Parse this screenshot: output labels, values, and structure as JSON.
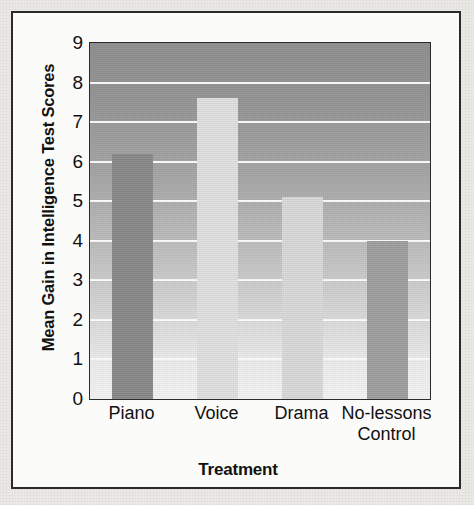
{
  "chart_data": {
    "type": "bar",
    "title": "",
    "subtitle": "",
    "xlabel": "Treatment",
    "ylabel": "Mean Gain in Intelligence Test Scores",
    "categories": [
      "Piano",
      "Voice",
      "Drama",
      "No-lessons Control"
    ],
    "category_lines": [
      [
        "Piano"
      ],
      [
        "Voice"
      ],
      [
        "Drama"
      ],
      [
        "No-lessons",
        "Control"
      ]
    ],
    "values": [
      6.2,
      7.6,
      5.1,
      4.0
    ],
    "ylim": [
      0,
      9
    ],
    "yticks": [
      9,
      8,
      7,
      6,
      5,
      4,
      3,
      2,
      1,
      0
    ],
    "xlim_categories": 4,
    "grid": true,
    "grid_axis": "y",
    "grid_color": "#fdfdfd",
    "legend": false,
    "legend_position": "none",
    "bar_colors": [
      "#8a8a8a",
      "#e3e3e3",
      "#dcdcdc",
      "#a0a0a0"
    ],
    "plot_background": "gradient-gray-dark-top-to-light-bottom",
    "frame_color": "#2a2a2a",
    "page_background": "#eceae7"
  }
}
